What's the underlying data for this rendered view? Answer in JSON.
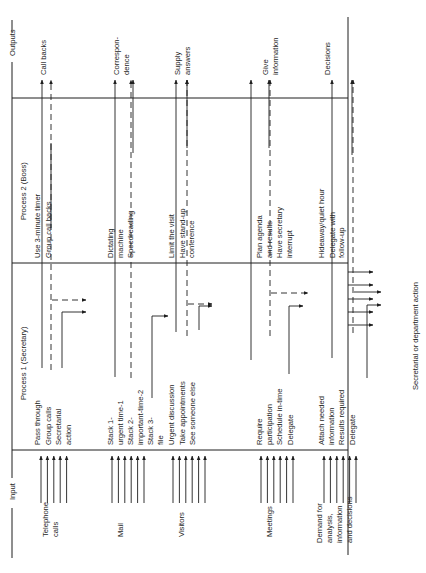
{
  "diagram": {
    "orientation": "rotated 90 degrees counter-clockwise",
    "zones": {
      "input": "Input",
      "process1": "Process 1 (Secretary)",
      "process2": "Process 2 (Boss)",
      "outputs": "Outputs"
    },
    "side_label": "Secretarial or department action",
    "rows": [
      {
        "input": [
          "Telephone",
          "calls"
        ],
        "input_arrows": 5,
        "process1": [
          [
            "Pass through"
          ],
          [
            "Group calls"
          ],
          [
            "Secretarial",
            "action"
          ]
        ],
        "process2": [
          [
            "Use 3-minute timer"
          ],
          [
            "Group call backs"
          ]
        ],
        "output": [
          "Call backs"
        ]
      },
      {
        "input": [
          "Mail"
        ],
        "input_arrows": 6,
        "process1": [
          [
            "Stack 1-",
            "urgent time-1"
          ],
          [
            "Stack 2-",
            "important-time-2"
          ],
          [
            "Stack 3-",
            "file"
          ]
        ],
        "process2": [
          [
            "Dictating",
            "machine"
          ],
          [
            "Speedreading"
          ]
        ],
        "output": [
          "Correspon-",
          "dence"
        ]
      },
      {
        "input": [
          "Visitors"
        ],
        "input_arrows": 6,
        "process1": [
          [
            "Urgent discussion"
          ],
          [
            "Take appointments"
          ],
          [
            "See someone else"
          ]
        ],
        "process2": [
          [
            "Limit the visit"
          ],
          [
            "Have stand-up",
            "conference"
          ]
        ],
        "output": [
          "Supply",
          "answers"
        ]
      },
      {
        "input": [
          "Meetings"
        ],
        "input_arrows": 6,
        "process1": [
          [
            "Require",
            "participation"
          ],
          [
            "Schedule in-time"
          ],
          [
            "Delegate"
          ]
        ],
        "process2": [
          [
            "Plan agenda",
            "and results"
          ],
          [
            "Have secretary",
            "interrupt"
          ]
        ],
        "output": [
          "Give",
          "information"
        ]
      },
      {
        "input": [
          "Demand for",
          "analysis,",
          "information",
          "and decisions"
        ],
        "input_arrows": 6,
        "process1": [
          [
            "Attach needed",
            "information"
          ],
          [
            "Results required"
          ],
          [
            "Delegate"
          ]
        ],
        "process2": [
          [
            "Hideaway/quiet hour"
          ],
          [
            "Delegate with",
            "follow-up"
          ]
        ],
        "output": [
          "Decisions"
        ]
      }
    ]
  }
}
